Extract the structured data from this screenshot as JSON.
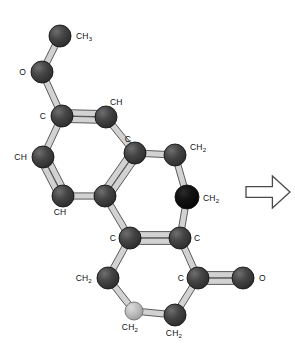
{
  "figure": {
    "name": "molecular-structure-ball-and-stick",
    "background_color": "#ffffff",
    "width": 295,
    "height": 359
  },
  "palette": {
    "atom_dark": "#3a3a3a",
    "atom_black": "#0a0a0a",
    "atom_light": "#b0b0b0",
    "atom_outline": "#151515",
    "bond_fill": "#d2d2d2",
    "bond_outline": "#4a4a4a",
    "label_color": "#111111",
    "arrow_fill": "#ffffff",
    "arrow_outline": "#4a4a4a"
  },
  "atoms": [
    {
      "id": "a1",
      "label": "CH",
      "sub": "3",
      "x": 60,
      "y": 36,
      "r": 11,
      "shade": "dark",
      "label_x": 76,
      "label_y": 39,
      "anchor": "start"
    },
    {
      "id": "a2",
      "label": "O",
      "sub": "",
      "x": 42,
      "y": 72,
      "r": 11,
      "shade": "dark",
      "label_x": 26,
      "label_y": 75,
      "anchor": "end"
    },
    {
      "id": "a3",
      "label": "C",
      "sub": "",
      "x": 62,
      "y": 116,
      "r": 11,
      "shade": "dark",
      "label_x": 46,
      "label_y": 119,
      "anchor": "end"
    },
    {
      "id": "a4",
      "label": "CH",
      "sub": "",
      "x": 106,
      "y": 117,
      "r": 11,
      "shade": "dark",
      "label_x": 110,
      "label_y": 105,
      "anchor": "start"
    },
    {
      "id": "a5",
      "label": "C",
      "sub": "",
      "x": 135,
      "y": 153,
      "r": 11,
      "shade": "dark",
      "label_x": 131,
      "label_y": 142,
      "anchor": "end"
    },
    {
      "id": "a6",
      "label": "CH",
      "sub": "",
      "x": 43,
      "y": 157,
      "r": 11,
      "shade": "dark",
      "label_x": 27,
      "label_y": 160,
      "anchor": "end"
    },
    {
      "id": "a7",
      "label": "CH",
      "sub": "",
      "x": 63,
      "y": 196,
      "r": 11,
      "shade": "dark",
      "label_x": 60,
      "label_y": 215,
      "anchor": "middle"
    },
    {
      "id": "a8",
      "label": "",
      "sub": "",
      "x": 105,
      "y": 196,
      "r": 11,
      "shade": "dark",
      "label_x": 0,
      "label_y": 0,
      "anchor": "middle"
    },
    {
      "id": "a9",
      "label": "CH",
      "sub": "2",
      "x": 175,
      "y": 155,
      "r": 11,
      "shade": "dark",
      "label_x": 190,
      "label_y": 150,
      "anchor": "start"
    },
    {
      "id": "a10",
      "label": "CH",
      "sub": "2",
      "x": 187,
      "y": 197,
      "r": 12,
      "shade": "black",
      "label_x": 203,
      "label_y": 201,
      "anchor": "start"
    },
    {
      "id": "a11",
      "label": "C",
      "sub": "",
      "x": 130,
      "y": 238,
      "r": 11,
      "shade": "dark",
      "label_x": 116,
      "label_y": 241,
      "anchor": "end"
    },
    {
      "id": "a12",
      "label": "C",
      "sub": "",
      "x": 180,
      "y": 238,
      "r": 11,
      "shade": "dark",
      "label_x": 194,
      "label_y": 241,
      "anchor": "start"
    },
    {
      "id": "a13",
      "label": "CH",
      "sub": "2",
      "x": 108,
      "y": 278,
      "r": 11,
      "shade": "dark",
      "label_x": 92,
      "label_y": 281,
      "anchor": "end"
    },
    {
      "id": "a14",
      "label": "C",
      "sub": "",
      "x": 198,
      "y": 278,
      "r": 11,
      "shade": "dark",
      "label_x": 184,
      "label_y": 281,
      "anchor": "end"
    },
    {
      "id": "a15",
      "label": "O",
      "sub": "",
      "x": 243,
      "y": 278,
      "r": 11,
      "shade": "dark",
      "label_x": 259,
      "label_y": 281,
      "anchor": "start"
    },
    {
      "id": "a16",
      "label": "CH",
      "sub": "2",
      "x": 134,
      "y": 311,
      "r": 9,
      "shade": "light",
      "label_x": 130,
      "label_y": 330,
      "anchor": "middle"
    },
    {
      "id": "a17",
      "label": "CH",
      "sub": "2",
      "x": 175,
      "y": 315,
      "r": 11,
      "shade": "dark",
      "label_x": 174,
      "label_y": 336,
      "anchor": "middle"
    }
  ],
  "bonds": [
    {
      "from": "a1",
      "to": "a2",
      "order": 1
    },
    {
      "from": "a2",
      "to": "a3",
      "order": 1
    },
    {
      "from": "a3",
      "to": "a4",
      "order": 2
    },
    {
      "from": "a4",
      "to": "a5",
      "order": 1
    },
    {
      "from": "a3",
      "to": "a6",
      "order": 1
    },
    {
      "from": "a6",
      "to": "a7",
      "order": 2
    },
    {
      "from": "a7",
      "to": "a8",
      "order": 1
    },
    {
      "from": "a8",
      "to": "a5",
      "order": 2
    },
    {
      "from": "a5",
      "to": "a9",
      "order": 1
    },
    {
      "from": "a9",
      "to": "a10",
      "order": 1
    },
    {
      "from": "a10",
      "to": "a12",
      "order": 1
    },
    {
      "from": "a8",
      "to": "a11",
      "order": 1
    },
    {
      "from": "a11",
      "to": "a12",
      "order": 2
    },
    {
      "from": "a11",
      "to": "a13",
      "order": 1
    },
    {
      "from": "a13",
      "to": "a16",
      "order": 1
    },
    {
      "from": "a16",
      "to": "a17",
      "order": 1
    },
    {
      "from": "a17",
      "to": "a14",
      "order": 1
    },
    {
      "from": "a14",
      "to": "a12",
      "order": 1
    },
    {
      "from": "a14",
      "to": "a15",
      "order": 2
    }
  ],
  "arrow": {
    "name": "reaction-arrow-right",
    "direction": "right",
    "x": 246,
    "y": 176,
    "width": 44,
    "height": 32
  }
}
